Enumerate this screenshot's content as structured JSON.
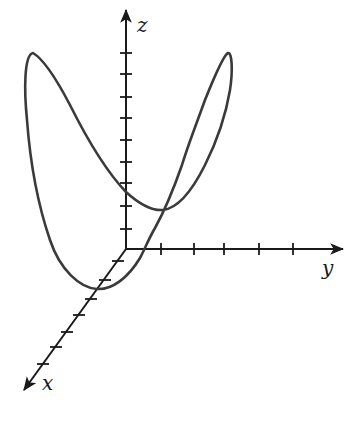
{
  "figure": {
    "colors": {
      "axes": "#1a1a1a",
      "curve": "#3a3a3a",
      "background": "#ffffff"
    }
  },
  "axes": {
    "origin": [
      126,
      249
    ],
    "x": {
      "label": "x",
      "tip": [
        24,
        390
      ],
      "label_pos": [
        42,
        390
      ],
      "ticks": [
        [
          118,
          261
        ],
        [
          105,
          280
        ],
        [
          91,
          299
        ],
        [
          79,
          315
        ],
        [
          67,
          332
        ],
        [
          56,
          347
        ],
        [
          43,
          364
        ]
      ]
    },
    "y": {
      "label": "y",
      "tip": [
        343,
        249
      ],
      "label_pos": [
        322,
        275
      ],
      "ticks": [
        161,
        194,
        224,
        259,
        293
      ]
    },
    "z": {
      "label": "z",
      "tip": [
        126,
        10
      ],
      "label_pos": [
        137,
        32
      ],
      "ticks": [
        53,
        74,
        97,
        118,
        140,
        162,
        183,
        206,
        229
      ]
    }
  },
  "curve": {
    "type": "closed-space-curve",
    "path": "M 33 53 C 45 60, 58 82, 70 105 C 85 135, 105 170, 126 192 C 138 203, 150 211, 163 210 C 180 208, 195 185, 205 165 C 215 145, 225 120, 230 90 C 233 70, 232 52, 228 53 C 224 55, 215 75, 205 100 C 196 125, 188 145, 182 165 C 175 185, 165 210, 155 228 C 148 240, 145 249, 140 258 C 128 278, 112 290, 97 289 C 80 288, 60 270, 50 240 C 38 205, 30 160, 27 120 C 24 90, 24 55, 33 53 Z"
  }
}
